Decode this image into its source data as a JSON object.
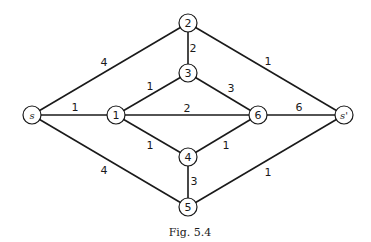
{
  "caption": "Fig. 5.4",
  "nodes": [
    {
      "id": "s",
      "label": "s",
      "x": 32,
      "y": 115,
      "italic": true
    },
    {
      "id": "1",
      "label": "1",
      "x": 116,
      "y": 115,
      "italic": false
    },
    {
      "id": "2",
      "label": "2",
      "x": 188,
      "y": 23,
      "italic": false
    },
    {
      "id": "3",
      "label": "3",
      "x": 188,
      "y": 73,
      "italic": false
    },
    {
      "id": "4",
      "label": "4",
      "x": 188,
      "y": 157,
      "italic": false
    },
    {
      "id": "5",
      "label": "5",
      "x": 188,
      "y": 207,
      "italic": false
    },
    {
      "id": "6",
      "label": "6",
      "x": 258,
      "y": 115,
      "italic": false
    },
    {
      "id": "sp",
      "label": "s'",
      "x": 344,
      "y": 115,
      "italic": true
    }
  ],
  "edges": [
    {
      "from": "s",
      "to": "2",
      "weight": "4",
      "lx": 104,
      "ly": 62
    },
    {
      "from": "s",
      "to": "1",
      "weight": "1",
      "lx": 75,
      "ly": 107
    },
    {
      "from": "s",
      "to": "5",
      "weight": "4",
      "lx": 104,
      "ly": 170
    },
    {
      "from": "1",
      "to": "3",
      "weight": "1",
      "lx": 150,
      "ly": 86
    },
    {
      "from": "1",
      "to": "6",
      "weight": "2",
      "lx": 187,
      "ly": 108
    },
    {
      "from": "1",
      "to": "4",
      "weight": "1",
      "lx": 150,
      "ly": 145
    },
    {
      "from": "2",
      "to": "3",
      "weight": "2",
      "lx": 193,
      "ly": 48
    },
    {
      "from": "2",
      "to": "sp",
      "weight": "1",
      "lx": 268,
      "ly": 61
    },
    {
      "from": "3",
      "to": "6",
      "weight": "3",
      "lx": 231,
      "ly": 88
    },
    {
      "from": "4",
      "to": "6",
      "weight": "1",
      "lx": 226,
      "ly": 145
    },
    {
      "from": "4",
      "to": "5",
      "weight": "3",
      "lx": 194,
      "ly": 181
    },
    {
      "from": "6",
      "to": "sp",
      "weight": "6",
      "lx": 299,
      "ly": 107
    },
    {
      "from": "5",
      "to": "sp",
      "weight": "1",
      "lx": 268,
      "ly": 172
    }
  ]
}
